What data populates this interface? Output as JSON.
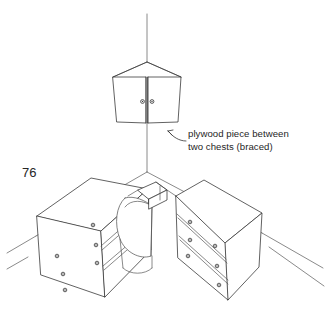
{
  "figure": {
    "page_number": "76",
    "background_color": "#ffffff",
    "line_color": "#3a3a3a",
    "caption": {
      "line1": "plywood piece between",
      "line2": "two chests (braced)"
    },
    "parts": {
      "wall_corner_label": "corner-wall-line",
      "upper_cabinet_label": "corner wall cabinet",
      "left_chest_label": "left chest of drawers",
      "right_chest_label": "right chest of drawers",
      "plywood_label": "plywood piece",
      "rounded_corner_label": "rounded corner filler"
    },
    "counts": {
      "upper_cabinet_doors": 2,
      "upper_cabinet_knobs": 2,
      "left_chest_drawers": 3,
      "right_chest_drawers": 3,
      "knobs_per_drawer": 2
    }
  },
  "geometry": {
    "wall": {
      "vertical_line": "M147,14 L147,62",
      "left_eave": "M147,62 L113,77",
      "right_eave": "M147,62 L181,77",
      "corner_drop": "M147,123 L147,172",
      "floor_left": "M147,172 L36,236",
      "floor_right": "M147,172 L262,233",
      "skirt_left_a": "M36,236 L7,253",
      "skirt_left_b": "M28,257 L7,269",
      "skirt_right_a": "M262,233 L323,268",
      "skirt_right_b": "M269,247 L324,286"
    },
    "cabinet": {
      "left_door": "M113,77 L146,77 L146,123 L117,122 Z",
      "right_door": "M148,77 L181,77 L178,122 L148,123 Z",
      "center_stile": "M146,77 L146,123 M148,77 L148,123",
      "top_ridge": "M113,77 L147,62 L181,77",
      "knob_left": {
        "cx": 142.5,
        "cy": 101.5,
        "r": 1.9
      },
      "knob_right": {
        "cx": 152.0,
        "cy": 101.5,
        "r": 1.9
      }
    },
    "left_chest": {
      "top": "M37,216 L91,178 L148,189 L101,231 Z",
      "front": "M101,231 L148,189 L151,250 L105,297 Z",
      "side": "M37,216 L101,231 L105,297 L41,275 Z",
      "drawer_lines": [
        "M101,246 L148,205",
        "M102,250 L149,209",
        "M103,266 L150,226",
        "M104,270 L150,230"
      ],
      "knobs": [
        {
          "cx": 57,
          "cy": 256,
          "r": 1.8
        },
        {
          "cx": 93,
          "cy": 225,
          "r": 1.8
        },
        {
          "cx": 63,
          "cy": 274,
          "r": 1.8
        },
        {
          "cx": 96,
          "cy": 245,
          "r": 1.8
        },
        {
          "cx": 65,
          "cy": 290,
          "r": 1.8
        },
        {
          "cx": 97,
          "cy": 263,
          "r": 1.8
        }
      ]
    },
    "right_chest": {
      "top": "M176,196 L204,180 L262,213 L225,243 Z",
      "front": "M176,196 L225,243 L228,300 L178,258 Z",
      "side": "M225,243 L262,213 L259,267 L228,300 Z",
      "drawer_lines": [
        "M177,214 L226,259",
        "M178,218 L227,263",
        "M179,236 L228,280",
        "M180,240 L228,284"
      ],
      "knobs": [
        {
          "cx": 190,
          "cy": 222,
          "r": 1.8
        },
        {
          "cx": 215,
          "cy": 246,
          "r": 1.8
        },
        {
          "cx": 190,
          "cy": 240,
          "r": 1.8
        },
        {
          "cx": 217,
          "cy": 266,
          "r": 1.8
        },
        {
          "cx": 188,
          "cy": 256,
          "r": 1.8
        },
        {
          "cx": 219,
          "cy": 285,
          "r": 1.8
        }
      ]
    },
    "plywood": {
      "top_plate": "M138,190 L156,182 L167,190 L149,199 Z",
      "edge_front": "M149,199 L167,190 L167,200 L149,209 Z",
      "brace_a": "M156,182 L167,190",
      "brace_b": "M160,186 L160,200",
      "join_left": "M138,190 L128,196",
      "join_right": "M167,190 L176,196"
    },
    "rounded_corner": {
      "outline": "M125,198 C116,206 114,224 120,239 C125,252 140,260 151,256 L152,206 C146,201 134,195 125,198 Z",
      "inner_curve": "M152,206 C143,200 131,199 125,207",
      "body_left": "M120,239 L123,268",
      "body_right": "M152,256 L152,268",
      "bottom_curve": "M123,268 C130,275 145,275 152,268",
      "side_seam": "M151,256 L152,206"
    },
    "leader": {
      "arc": "M186,141 C179,141 173,137 168,131",
      "head": "M168,131 L172,135 M168,131 L173,130"
    }
  }
}
